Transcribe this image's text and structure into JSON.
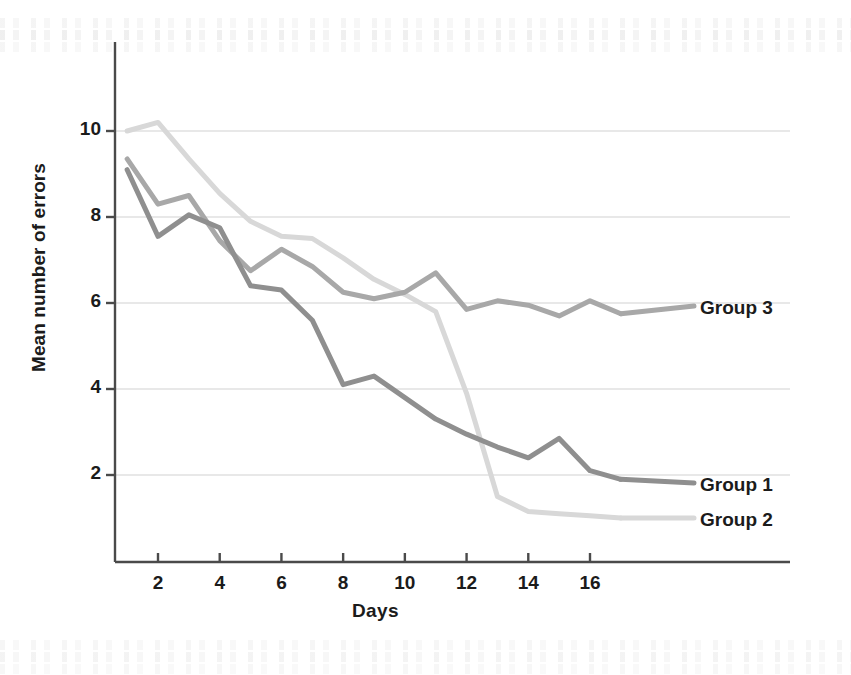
{
  "figure": {
    "background": "#ffffff",
    "plot_area": {
      "left": 115,
      "top": 42,
      "right": 790,
      "bottom": 562
    }
  },
  "axes": {
    "y_title": "Mean number of errors",
    "x_title": "Days",
    "y_ticks": [
      2,
      4,
      6,
      8,
      10
    ],
    "x_ticks": [
      2,
      4,
      6,
      8,
      10,
      12,
      14,
      16
    ],
    "y_tick_labels": [
      "2",
      "4",
      "6",
      "8",
      "10"
    ],
    "x_tick_labels": [
      "2",
      "4",
      "6",
      "8",
      "10",
      "12",
      "14",
      "16"
    ],
    "grid": true,
    "grid_color": "#c9c9c9",
    "axis_color": "#4a4a4a"
  },
  "series_labels": [
    {
      "name": "group-3-label",
      "text": "Group 3",
      "x": 700,
      "y": 297
    },
    {
      "name": "group-1-label",
      "text": "Group 1",
      "x": 700,
      "y": 474
    },
    {
      "name": "group-2-label",
      "text": "Group 2",
      "x": 700,
      "y": 509
    }
  ],
  "chart_data": {
    "type": "line",
    "title": "",
    "xlabel": "Days",
    "ylabel": "Mean number of errors",
    "xlim": [
      1,
      17
    ],
    "ylim": [
      0.4,
      11.4
    ],
    "xticks": [
      2,
      4,
      6,
      8,
      10,
      12,
      14,
      16
    ],
    "yticks": [
      2,
      4,
      6,
      8,
      10
    ],
    "grid": true,
    "legend": "inline-right-of-line-ends",
    "x": [
      1,
      2,
      3,
      4,
      5,
      6,
      7,
      8,
      9,
      10,
      11,
      12,
      13,
      14,
      15,
      16,
      17
    ],
    "series": [
      {
        "name": "Group 1",
        "color": "#8f8f8f",
        "linewidth": 5,
        "values": [
          9.1,
          7.55,
          8.05,
          7.75,
          6.4,
          6.3,
          5.6,
          4.1,
          4.3,
          3.8,
          3.3,
          2.95,
          2.65,
          2.4,
          2.85,
          2.1,
          1.9
        ]
      },
      {
        "name": "Group 2",
        "color": "#d8d8d8",
        "linewidth": 5,
        "values": [
          10.0,
          10.2,
          9.35,
          8.55,
          7.9,
          7.55,
          7.5,
          7.05,
          6.55,
          6.2,
          5.8,
          3.9,
          1.5,
          1.15,
          1.1,
          1.05,
          1.0
        ]
      },
      {
        "name": "Group 3",
        "color": "#a8a8a8",
        "linewidth": 5,
        "values": [
          9.35,
          8.3,
          8.5,
          7.45,
          6.75,
          7.25,
          6.85,
          6.25,
          6.1,
          6.25,
          6.7,
          5.85,
          6.05,
          5.95,
          5.7,
          6.05,
          5.75
        ]
      }
    ]
  }
}
